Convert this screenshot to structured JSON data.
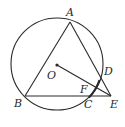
{
  "diagram": {
    "type": "geometry",
    "colors": {
      "stroke": "#2a2a2a",
      "background": "#ffffff"
    },
    "circle": {
      "center_label": "O",
      "cx": 57,
      "cy": 64,
      "r": 46
    },
    "points": {
      "A": {
        "label": "A",
        "x": 70,
        "y": 22
      },
      "B": {
        "label": "B",
        "x": 25,
        "y": 96
      },
      "C": {
        "label": "C",
        "x": 89,
        "y": 97
      },
      "D": {
        "label": "D",
        "x": 99,
        "y": 80
      },
      "E": {
        "label": "E",
        "x": 111,
        "y": 96
      },
      "F": {
        "label": "F",
        "x": 95,
        "y": 88
      },
      "O": {
        "label": "O",
        "x": 57,
        "y": 65
      }
    },
    "segments": [
      "AB",
      "AE",
      "BE",
      "OE"
    ],
    "highlighted_arc": "DC"
  }
}
